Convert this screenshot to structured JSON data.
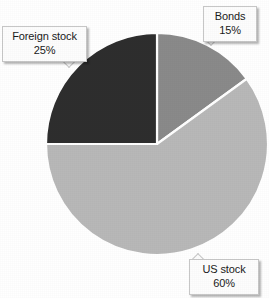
{
  "chart_data": {
    "type": "pie",
    "title": "",
    "subtitle": "",
    "xlabel": "",
    "ylabel": "",
    "legend_position": "none",
    "grid": false,
    "units": "percent",
    "start_angle_deg": 0,
    "direction": "clockwise",
    "center": {
      "x": 157,
      "y": 144
    },
    "radius": 111,
    "categories": [
      "Bonds",
      "US stock",
      "Foreign stock"
    ],
    "values": [
      15,
      60,
      25
    ],
    "slices": [
      {
        "label": "Bonds",
        "value": 15,
        "value_text": "15%",
        "color": "#8a8a8a",
        "start_deg": 0,
        "end_deg": 54
      },
      {
        "label": "US stock",
        "value": 60,
        "value_text": "60%",
        "color": "#b8b8b8",
        "start_deg": 54,
        "end_deg": 270
      },
      {
        "label": "Foreign stock",
        "value": 25,
        "value_text": "25%",
        "color": "#2e2e2e",
        "start_deg": 270,
        "end_deg": 360
      }
    ],
    "separator_color": "#ffffff",
    "background_color": "#ffffff"
  },
  "callouts": {
    "bonds": {
      "name": "Bonds",
      "percent": "15%"
    },
    "foreign": {
      "name": "Foreign stock",
      "percent": "25%"
    },
    "us": {
      "name": "US stock",
      "percent": "60%"
    }
  }
}
